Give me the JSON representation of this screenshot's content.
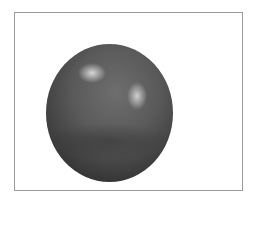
{
  "image": {
    "description": "3D rendered glossy dark gray sphere with two specular highlights, inside a thin gray rectangular border on white background",
    "colors": {
      "background": "#ffffff",
      "border": "#9a9a9a",
      "sphere_mid": "#5a5a5a",
      "sphere_dark": "#2e2e2e",
      "highlight": "#ebebeb"
    },
    "highlights": 2
  }
}
